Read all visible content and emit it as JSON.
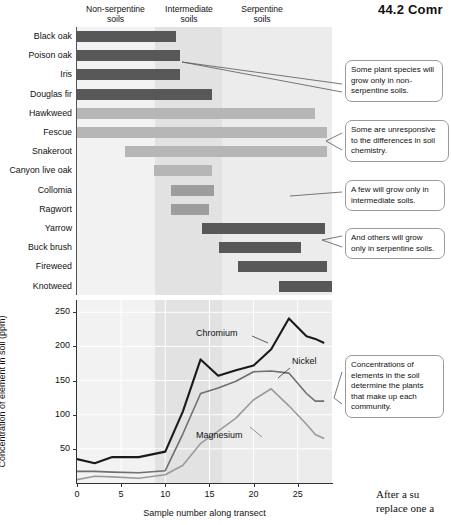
{
  "page": {
    "header": "44.2  Comr",
    "footer_line1": "After a su",
    "footer_line2": "replace one a"
  },
  "soil_columns": [
    {
      "name": "non-serpentine",
      "line1": "Non-serpentine",
      "line2": "soils"
    },
    {
      "name": "intermediate",
      "line1": "Intermediate",
      "line2": "soils"
    },
    {
      "name": "serpentine",
      "line1": "Serpentine",
      "line2": "soils"
    }
  ],
  "species_chart": {
    "type": "bar",
    "orientation": "horizontal",
    "xlabel": "",
    "species": [
      {
        "label": "Black oak",
        "start": 0,
        "end": 20.5,
        "tone": "dark"
      },
      {
        "label": "Poison oak",
        "start": 0,
        "end": 21.5,
        "tone": "dark"
      },
      {
        "label": "Iris",
        "start": 0,
        "end": 21.5,
        "tone": "dark"
      },
      {
        "label": "Douglas fir",
        "start": 0,
        "end": 28.0,
        "tone": "dark"
      },
      {
        "label": "Hawkweed",
        "start": 0,
        "end": 49.5,
        "tone": "light"
      },
      {
        "label": "Fescue",
        "start": 0,
        "end": 52.0,
        "tone": "light"
      },
      {
        "label": "Snakeroot",
        "start": 10.0,
        "end": 52.0,
        "tone": "light"
      },
      {
        "label": "Canyon live oak",
        "start": 16.0,
        "end": 28.0,
        "tone": "light"
      },
      {
        "label": "Collomia",
        "start": 19.5,
        "end": 28.5,
        "tone": "mid"
      },
      {
        "label": "Ragwort",
        "start": 19.5,
        "end": 27.5,
        "tone": "mid"
      },
      {
        "label": "Yarrow",
        "start": 26.0,
        "end": 51.5,
        "tone": "dark"
      },
      {
        "label": "Buck brush",
        "start": 29.5,
        "end": 46.5,
        "tone": "dark"
      },
      {
        "label": "Fireweed",
        "start": 33.5,
        "end": 52.0,
        "tone": "dark"
      },
      {
        "label": "Knotweed",
        "start": 42.0,
        "end": 53.0,
        "tone": "dark"
      }
    ]
  },
  "callouts": [
    {
      "id": "c1",
      "text": "Some plant species will grow only in non-serpentine soils."
    },
    {
      "id": "c2",
      "text": "Some are unresponsive to the differences in soil chemistry."
    },
    {
      "id": "c3",
      "text": "A few will grow only in intermediate soils."
    },
    {
      "id": "c4",
      "text": "And others will grow only in serpentine soils."
    },
    {
      "id": "c5",
      "text": "Concentrations of elements in the soil determine the plants that make up each community."
    }
  ],
  "chart_data": {
    "type": "line",
    "title": "",
    "xlabel": "Sample number along transect",
    "ylabel": "Concentration of element in soil (ppm)",
    "xlim": [
      0,
      29
    ],
    "ylim": [
      0,
      268
    ],
    "xticks": [
      0,
      5,
      10,
      15,
      20,
      25
    ],
    "yticks": [
      50,
      100,
      150,
      200,
      250
    ],
    "grid": true,
    "legend": "inline-annotations",
    "x": [
      0,
      2,
      4,
      7,
      10,
      12,
      14,
      16,
      18,
      20,
      22,
      24,
      26,
      27,
      28
    ],
    "series": [
      {
        "name": "Chromium",
        "color": "#1a1a1a",
        "values": [
          35,
          29,
          38,
          38,
          46,
          105,
          181,
          157,
          165,
          172,
          196,
          241,
          215,
          211,
          205
        ]
      },
      {
        "name": "Nickel",
        "color": "#6f6f6f",
        "values": [
          17,
          17,
          16,
          15,
          18,
          72,
          131,
          139,
          149,
          163,
          164,
          161,
          131,
          120,
          120
        ]
      },
      {
        "name": "Magnesium",
        "color": "#9a9a9a",
        "values": [
          5,
          10,
          9,
          7,
          12,
          26,
          58,
          76,
          95,
          122,
          138,
          113,
          86,
          71,
          65
        ]
      }
    ]
  }
}
